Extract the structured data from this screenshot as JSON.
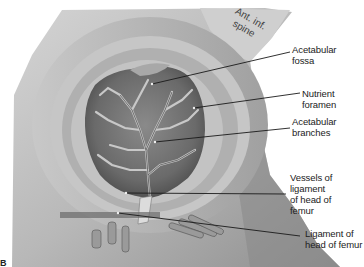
{
  "figure": {
    "letter": "B",
    "bone_annotation": {
      "line1": "Ant. inf.",
      "line2": "spine"
    },
    "colors": {
      "background": "#ffffff",
      "leader": "#1a1a1a",
      "label_text": "#222222"
    }
  },
  "labels": [
    {
      "id": "acetabular-fossa",
      "text": "Acetabular\nfossa"
    },
    {
      "id": "nutrient-foramen",
      "text": "Nutrient foramen"
    },
    {
      "id": "acetabular-branches",
      "text": "Acetabular\nbranches"
    },
    {
      "id": "vessels-of-ligament",
      "text": "Vessels of\nligament\nof head of\nfemur"
    },
    {
      "id": "ligament-of-head",
      "text": "Ligament of\nhead of femur"
    }
  ]
}
